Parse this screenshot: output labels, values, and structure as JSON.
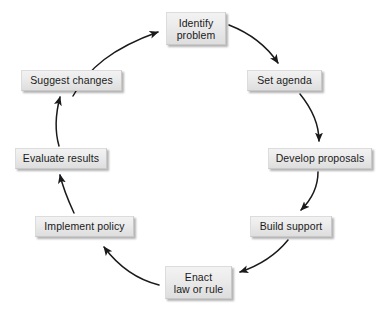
{
  "diagram": {
    "type": "cyclic-process",
    "direction": "clockwise",
    "background_color": "#ffffff",
    "node_fill_color": "#e9e9e9",
    "node_border_color": "#c9c9c9",
    "node_text_color": "#1a1a1a",
    "arrow_color": "#1a1a1a",
    "nodes": [
      {
        "id": "identify-problem",
        "label": "Identify\nproblem",
        "lines": [
          "Identify",
          "problem"
        ],
        "position": {
          "x": 166,
          "y": 12,
          "width": 60,
          "height": 33
        }
      },
      {
        "id": "set-agenda",
        "label": "Set agenda",
        "lines": [
          "Set agenda"
        ],
        "position": {
          "x": 247,
          "y": 70,
          "width": 75,
          "height": 21
        }
      },
      {
        "id": "develop-proposals",
        "label": "Develop proposals",
        "lines": [
          "Develop proposals"
        ],
        "position": {
          "x": 268,
          "y": 148,
          "width": 104,
          "height": 21
        }
      },
      {
        "id": "build-support",
        "label": "Build support",
        "lines": [
          "Build support"
        ],
        "position": {
          "x": 250,
          "y": 216,
          "width": 82,
          "height": 21
        }
      },
      {
        "id": "enact-law-or-rule",
        "label": "Enact\nlaw or rule",
        "lines": [
          "Enact",
          "law or rule"
        ],
        "position": {
          "x": 165,
          "y": 266,
          "width": 67,
          "height": 33
        }
      },
      {
        "id": "implement-policy",
        "label": "Implement policy",
        "lines": [
          "Implement policy"
        ],
        "position": {
          "x": 35,
          "y": 216,
          "width": 99,
          "height": 21
        }
      },
      {
        "id": "evaluate-results",
        "label": "Evaluate results",
        "lines": [
          "Evaluate results"
        ],
        "position": {
          "x": 15,
          "y": 148,
          "width": 92,
          "height": 21
        }
      },
      {
        "id": "suggest-changes",
        "label": "Suggest changes",
        "lines": [
          "Suggest changes"
        ],
        "position": {
          "x": 21,
          "y": 70,
          "width": 101,
          "height": 21
        }
      }
    ],
    "arrows": [
      {
        "id": "arrow-identify-to-set-agenda",
        "from": "identify-problem",
        "to": "set-agenda",
        "path": "M 229 25 C 252 34, 268 48, 278 63"
      },
      {
        "id": "arrow-set-agenda-to-develop",
        "from": "set-agenda",
        "to": "develop-proposals",
        "path": "M 300 94 C 313 110, 319 126, 319 141"
      },
      {
        "id": "arrow-develop-to-build-support",
        "from": "develop-proposals",
        "to": "build-support",
        "path": "M 318 172 C 318 188, 311 200, 301 210"
      },
      {
        "id": "arrow-build-support-to-enact",
        "from": "build-support",
        "to": "enact-law-or-rule",
        "path": "M 288 240 C 275 256, 258 266, 240 272"
      },
      {
        "id": "arrow-enact-to-implement",
        "from": "enact-law-or-rule",
        "to": "implement-policy",
        "path": "M 159 285 C 139 280, 119 267, 104 247"
      },
      {
        "id": "arrow-implement-to-evaluate",
        "from": "implement-policy",
        "to": "evaluate-results",
        "path": "M 74 213 C 68 200, 63 188, 60 175"
      },
      {
        "id": "arrow-evaluate-to-suggest",
        "from": "evaluate-results",
        "to": "suggest-changes",
        "path": "M 59 146 C 55 132, 55 116, 60 97"
      },
      {
        "id": "arrow-suggest-to-identify",
        "from": "suggest-changes",
        "to": "identify-problem",
        "path": "M 73 96 C 88 68, 113 48, 158 32"
      }
    ]
  }
}
